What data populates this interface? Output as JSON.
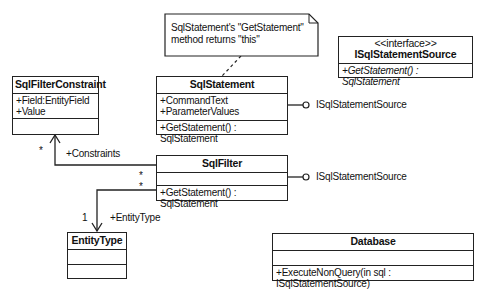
{
  "note": {
    "line1": "SqlStatement's \"GetStatement\"",
    "line2": "method returns \"this\""
  },
  "classes": {
    "sql_filter_constraint": {
      "name": "SqlFilterConstraint",
      "attributes": [
        "+Field:EntityField",
        "+Value"
      ],
      "methods": []
    },
    "sql_statement": {
      "name": "SqlStatement",
      "attributes": [
        "+CommandText",
        "+ParameterValues"
      ],
      "methods": [
        "+GetStatement() : SqlStatement"
      ]
    },
    "isql_statement_source": {
      "stereotype": "<<interface>>",
      "name": "ISqlStatementSource",
      "methods": [
        "+GetStatement() : SqlStatement"
      ]
    },
    "sql_filter": {
      "name": "SqlFilter",
      "attributes": [],
      "methods": [
        "+GetStatement() : SqlStatement"
      ]
    },
    "entity_type": {
      "name": "EntityType",
      "attributes": [],
      "methods": []
    },
    "database": {
      "name": "Database",
      "attributes": [],
      "methods": [
        "+ExecuteNonQuery(in sql : ISqlStatementSource)"
      ]
    }
  },
  "interfaces_provided": {
    "sql_statement": "ISqlStatementSource",
    "sql_filter": "ISqlStatementSource"
  },
  "associations": {
    "constraints": {
      "role": "+Constraints",
      "target_mult": "*",
      "source_mult": "*"
    },
    "entity_type": {
      "role": "+EntityType",
      "target_mult": "1",
      "source_mult": "*"
    }
  }
}
